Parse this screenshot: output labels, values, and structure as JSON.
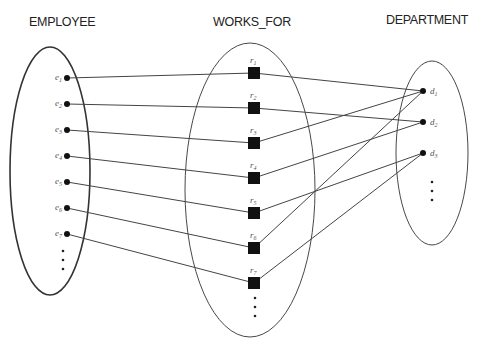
{
  "diagram": {
    "type": "ER relationship instance diagram",
    "headers": {
      "employee": "EMPLOYEE",
      "works_for": "WORKS_FOR",
      "department": "DEPARTMENT"
    },
    "employees": [
      {
        "id": "e1",
        "base": "e",
        "sub": "1"
      },
      {
        "id": "e2",
        "base": "e",
        "sub": "2"
      },
      {
        "id": "e3",
        "base": "e",
        "sub": "3"
      },
      {
        "id": "e4",
        "base": "e",
        "sub": "4"
      },
      {
        "id": "e5",
        "base": "e",
        "sub": "5"
      },
      {
        "id": "e6",
        "base": "e",
        "sub": "6"
      },
      {
        "id": "e7",
        "base": "e",
        "sub": "7"
      }
    ],
    "relationships": [
      {
        "id": "r1",
        "base": "r",
        "sub": "1"
      },
      {
        "id": "r2",
        "base": "r",
        "sub": "2"
      },
      {
        "id": "r3",
        "base": "r",
        "sub": "3"
      },
      {
        "id": "r4",
        "base": "r",
        "sub": "4"
      },
      {
        "id": "r5",
        "base": "r",
        "sub": "5"
      },
      {
        "id": "r6",
        "base": "r",
        "sub": "6"
      },
      {
        "id": "r7",
        "base": "r",
        "sub": "7"
      }
    ],
    "departments": [
      {
        "id": "d1",
        "base": "d",
        "sub": "1"
      },
      {
        "id": "d2",
        "base": "d",
        "sub": "2"
      },
      {
        "id": "d3",
        "base": "d",
        "sub": "3"
      }
    ],
    "links_employee_to_relationship": [
      [
        "e1",
        "r1"
      ],
      [
        "e2",
        "r2"
      ],
      [
        "e3",
        "r3"
      ],
      [
        "e4",
        "r4"
      ],
      [
        "e5",
        "r5"
      ],
      [
        "e6",
        "r6"
      ],
      [
        "e7",
        "r7"
      ]
    ],
    "links_relationship_to_department": [
      [
        "r1",
        "d1"
      ],
      [
        "r2",
        "d2"
      ],
      [
        "r3",
        "d1"
      ],
      [
        "r4",
        "d2"
      ],
      [
        "r5",
        "d3"
      ],
      [
        "r6",
        "d1"
      ],
      [
        "r7",
        "d3"
      ]
    ],
    "continuation_marker": "..."
  }
}
